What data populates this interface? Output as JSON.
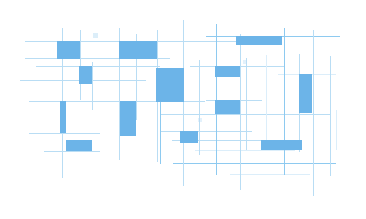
{
  "artwork": {
    "title": "Abstract blue grid composition",
    "description": "Decorative abstract graphic made of thin light-blue grid lines and solid blue rectangles of varying sizes scattered across a white canvas.",
    "canvas": {
      "width": 366,
      "height": 219,
      "background_color": "#ffffff"
    },
    "palette": {
      "block_fill": "#6cb4e8",
      "block_fill_alt": "#74b9ea",
      "line_strong": "#8ecaf0",
      "line_mid": "#b9ddf4",
      "line_faint": "#dceefa",
      "background": "#ffffff"
    },
    "counts": {
      "blocks": 16,
      "horizontal_lines": 17,
      "vertical_lines": 18
    }
  },
  "chart_data": {
    "type": "scatter",
    "title": "Abstract blue grid composition",
    "xlabel": "",
    "ylabel": "",
    "xlim": [
      0,
      366
    ],
    "ylim": [
      0,
      219
    ],
    "grid": true,
    "legend": "none",
    "blocks": [
      {
        "id": "block-01",
        "x": 57,
        "y": 41,
        "w": 23,
        "h": 18,
        "color": "#6cb4e8",
        "opacity": 1.0
      },
      {
        "id": "block-02",
        "x": 119,
        "y": 41,
        "w": 38,
        "h": 18,
        "color": "#6cb4e8",
        "opacity": 1.0
      },
      {
        "id": "block-03",
        "x": 236,
        "y": 36,
        "w": 46,
        "h": 9,
        "color": "#6cb4e8",
        "opacity": 1.0
      },
      {
        "id": "block-04",
        "x": 79,
        "y": 66,
        "w": 13,
        "h": 18,
        "color": "#6cb4e8",
        "opacity": 1.0
      },
      {
        "id": "block-05",
        "x": 156,
        "y": 68,
        "w": 28,
        "h": 34,
        "color": "#6cb4e8",
        "opacity": 1.0
      },
      {
        "id": "block-06",
        "x": 215,
        "y": 66,
        "w": 25,
        "h": 11,
        "color": "#6cb4e8",
        "opacity": 1.0
      },
      {
        "id": "block-07",
        "x": 299,
        "y": 74,
        "w": 13,
        "h": 39,
        "color": "#6cb4e8",
        "opacity": 1.0
      },
      {
        "id": "block-08",
        "x": 215,
        "y": 100,
        "w": 25,
        "h": 14,
        "color": "#6cb4e8",
        "opacity": 1.0
      },
      {
        "id": "block-09",
        "x": 120,
        "y": 101,
        "w": 16,
        "h": 35,
        "color": "#6cb4e8",
        "opacity": 1.0
      },
      {
        "id": "block-10",
        "x": 60,
        "y": 101,
        "w": 6,
        "h": 32,
        "color": "#6cb4e8",
        "opacity": 1.0
      },
      {
        "id": "block-11",
        "x": 180,
        "y": 131,
        "w": 18,
        "h": 12,
        "color": "#6cb4e8",
        "opacity": 1.0
      },
      {
        "id": "block-12",
        "x": 66,
        "y": 140,
        "w": 26,
        "h": 11,
        "color": "#6cb4e8",
        "opacity": 1.0
      },
      {
        "id": "block-13",
        "x": 261,
        "y": 140,
        "w": 41,
        "h": 10,
        "color": "#6cb4e8",
        "opacity": 1.0
      },
      {
        "id": "block-14",
        "x": 93,
        "y": 33,
        "w": 5,
        "h": 5,
        "color": "#b9ddf4",
        "opacity": 0.5
      },
      {
        "id": "block-15",
        "x": 243,
        "y": 60,
        "w": 4,
        "h": 4,
        "color": "#b9ddf4",
        "opacity": 0.4
      },
      {
        "id": "block-16",
        "x": 198,
        "y": 118,
        "w": 4,
        "h": 4,
        "color": "#b9ddf4",
        "opacity": 0.4
      }
    ],
    "horizontal_lines": [
      {
        "id": "h-01",
        "x1": 25,
        "x2": 246,
        "y": 41,
        "color": "#b9ddf4",
        "width": 1.0
      },
      {
        "id": "h-02",
        "x1": 206,
        "x2": 340,
        "y": 36,
        "color": "#8ecaf0",
        "width": 1.0
      },
      {
        "id": "h-03",
        "x1": 25,
        "x2": 170,
        "y": 58,
        "color": "#b9ddf4",
        "width": 1.0
      },
      {
        "id": "h-04",
        "x1": 36,
        "x2": 160,
        "y": 66,
        "color": "#b9ddf4",
        "width": 1.0
      },
      {
        "id": "h-05",
        "x1": 190,
        "x2": 285,
        "y": 66,
        "color": "#b9ddf4",
        "width": 1.0
      },
      {
        "id": "h-06",
        "x1": 20,
        "x2": 146,
        "y": 80,
        "color": "#b9ddf4",
        "width": 1.0
      },
      {
        "id": "h-07",
        "x1": 278,
        "x2": 336,
        "y": 74,
        "color": "#dceefa",
        "width": 1.0
      },
      {
        "id": "h-08",
        "x1": 29,
        "x2": 205,
        "y": 101,
        "color": "#b9ddf4",
        "width": 1.0
      },
      {
        "id": "h-09",
        "x1": 206,
        "x2": 262,
        "y": 100,
        "color": "#b9ddf4",
        "width": 1.0
      },
      {
        "id": "h-10",
        "x1": 160,
        "x2": 330,
        "y": 114,
        "color": "#b9ddf4",
        "width": 1.0
      },
      {
        "id": "h-11",
        "x1": 29,
        "x2": 100,
        "y": 133,
        "color": "#b9ddf4",
        "width": 1.0
      },
      {
        "id": "h-12",
        "x1": 160,
        "x2": 252,
        "y": 131,
        "color": "#b9ddf4",
        "width": 1.0
      },
      {
        "id": "h-13",
        "x1": 44,
        "x2": 100,
        "y": 151,
        "color": "#b9ddf4",
        "width": 1.0
      },
      {
        "id": "h-14",
        "x1": 172,
        "x2": 300,
        "y": 140,
        "color": "#b9ddf4",
        "width": 1.0
      },
      {
        "id": "h-15",
        "x1": 173,
        "x2": 336,
        "y": 163,
        "color": "#8ecaf0",
        "width": 1.0
      },
      {
        "id": "h-16",
        "x1": 195,
        "x2": 295,
        "y": 150,
        "color": "#dceefa",
        "width": 1.0
      },
      {
        "id": "h-17",
        "x1": 230,
        "x2": 310,
        "y": 174,
        "color": "#dceefa",
        "width": 1.0
      }
    ],
    "vertical_lines": [
      {
        "id": "v-01",
        "y1": 28,
        "y2": 178,
        "x": 62,
        "color": "#b9ddf4",
        "width": 1.0
      },
      {
        "id": "v-02",
        "y1": 30,
        "y2": 100,
        "x": 80,
        "color": "#b9ddf4",
        "width": 1.0
      },
      {
        "id": "v-03",
        "y1": 62,
        "y2": 110,
        "x": 92,
        "color": "#b9ddf4",
        "width": 1.0
      },
      {
        "id": "v-04",
        "y1": 28,
        "y2": 160,
        "x": 119,
        "color": "#b9ddf4",
        "width": 1.0
      },
      {
        "id": "v-05",
        "y1": 34,
        "y2": 120,
        "x": 136,
        "color": "#b9ddf4",
        "width": 1.0
      },
      {
        "id": "v-06",
        "y1": 30,
        "y2": 162,
        "x": 157,
        "color": "#b9ddf4",
        "width": 1.0
      },
      {
        "id": "v-07",
        "y1": 78,
        "y2": 164,
        "x": 160,
        "color": "#8ecaf0",
        "width": 1.0
      },
      {
        "id": "v-08",
        "y1": 20,
        "y2": 186,
        "x": 183,
        "color": "#b9ddf4",
        "width": 1.0
      },
      {
        "id": "v-09",
        "y1": 60,
        "y2": 155,
        "x": 199,
        "color": "#b9ddf4",
        "width": 1.0
      },
      {
        "id": "v-10",
        "y1": 24,
        "y2": 175,
        "x": 216,
        "color": "#8ecaf0",
        "width": 1.0
      },
      {
        "id": "v-11",
        "y1": 34,
        "y2": 190,
        "x": 240,
        "color": "#b9ddf4",
        "width": 1.0
      },
      {
        "id": "v-12",
        "y1": 58,
        "y2": 150,
        "x": 246,
        "color": "#b9ddf4",
        "width": 1.0
      },
      {
        "id": "v-13",
        "y1": 55,
        "y2": 150,
        "x": 266,
        "color": "#dceefa",
        "width": 1.0
      },
      {
        "id": "v-14",
        "y1": 28,
        "y2": 175,
        "x": 284,
        "color": "#8ecaf0",
        "width": 1.0
      },
      {
        "id": "v-15",
        "y1": 54,
        "y2": 152,
        "x": 299,
        "color": "#b9ddf4",
        "width": 1.0
      },
      {
        "id": "v-16",
        "y1": 30,
        "y2": 196,
        "x": 313,
        "color": "#b9ddf4",
        "width": 1.0
      },
      {
        "id": "v-17",
        "y1": 56,
        "y2": 176,
        "x": 330,
        "color": "#b9ddf4",
        "width": 1.0
      },
      {
        "id": "v-18",
        "y1": 110,
        "y2": 150,
        "x": 336,
        "color": "#dceefa",
        "width": 1.0
      }
    ]
  }
}
